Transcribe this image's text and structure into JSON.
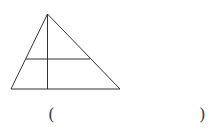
{
  "figure": {
    "shape": "triangle",
    "apex": [
      47.5,
      14
    ],
    "base_left": [
      11,
      89
    ],
    "base_right": [
      120,
      89
    ],
    "vertical_line": {
      "from": [
        47.5,
        14
      ],
      "to": [
        47.5,
        89
      ]
    },
    "horizontal_line": {
      "from": [
        26,
        59
      ],
      "to": [
        90,
        59
      ]
    },
    "stroke_color": "#333333"
  },
  "answer": {
    "open_paren": "(",
    "close_paren": ")",
    "value": ""
  }
}
